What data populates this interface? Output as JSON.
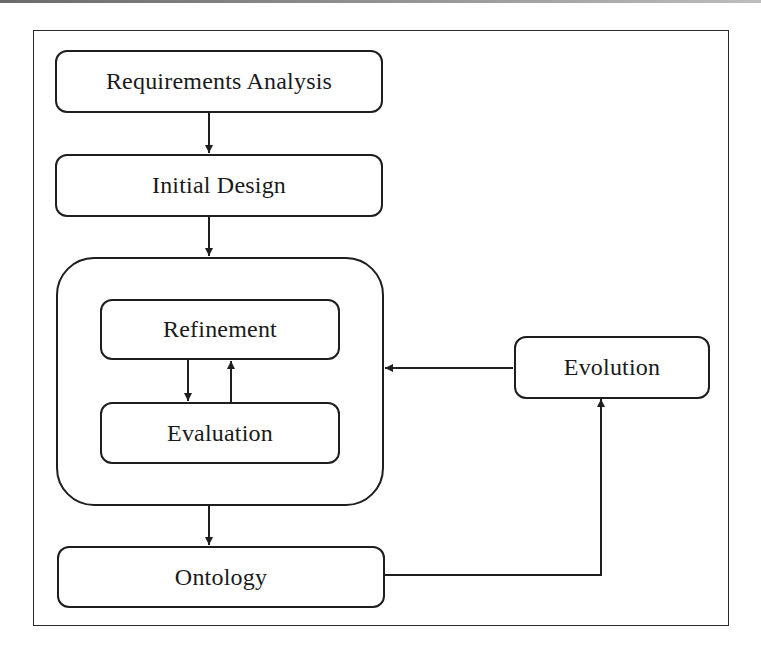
{
  "diagram": {
    "type": "process-flow",
    "nodes": {
      "requirements_analysis": {
        "label": "Requirements Analysis"
      },
      "initial_design": {
        "label": "Initial Design"
      },
      "refinement": {
        "label": "Refinement"
      },
      "evaluation": {
        "label": "Evaluation"
      },
      "evolution": {
        "label": "Evolution"
      },
      "ontology": {
        "label": "Ontology"
      }
    },
    "groups": [
      {
        "id": "iteration-loop",
        "contains": [
          "refinement",
          "evaluation"
        ]
      }
    ],
    "edges": [
      {
        "from": "requirements_analysis",
        "to": "initial_design"
      },
      {
        "from": "initial_design",
        "to": "iteration-loop"
      },
      {
        "from": "refinement",
        "to": "evaluation"
      },
      {
        "from": "evaluation",
        "to": "refinement"
      },
      {
        "from": "iteration-loop",
        "to": "ontology"
      },
      {
        "from": "ontology",
        "to": "evolution"
      },
      {
        "from": "evolution",
        "to": "iteration-loop"
      }
    ],
    "colors": {
      "stroke": "#1e1e1e",
      "background": "#ffffff"
    }
  }
}
